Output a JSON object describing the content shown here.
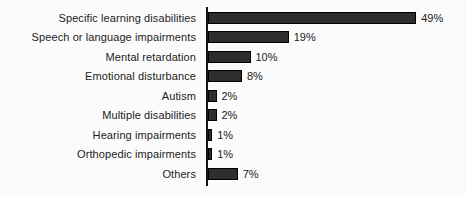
{
  "chart_data": {
    "type": "bar",
    "orientation": "horizontal",
    "title": "",
    "xlabel": "",
    "ylabel": "",
    "categories": [
      "Specific learning disabilities",
      "Speech or language impairments",
      "Mental retardation",
      "Emotional disturbance",
      "Autism",
      "Multiple disabilities",
      "Hearing impairments",
      "Orthopedic impairments",
      "Others"
    ],
    "values": [
      49,
      19,
      10,
      8,
      2,
      2,
      1,
      1,
      7
    ],
    "value_labels": [
      "49%",
      "19%",
      "10%",
      "8%",
      "2%",
      "2%",
      "1%",
      "1%",
      "7%"
    ],
    "xlim": [
      0,
      55
    ],
    "grid": false,
    "legend": "none",
    "bar_color": "#2d2d2d",
    "bar_border_color": "#000000",
    "axis_color": "#151515",
    "text_color": "#1c1c1c",
    "background_color": "#fbfbfb"
  }
}
